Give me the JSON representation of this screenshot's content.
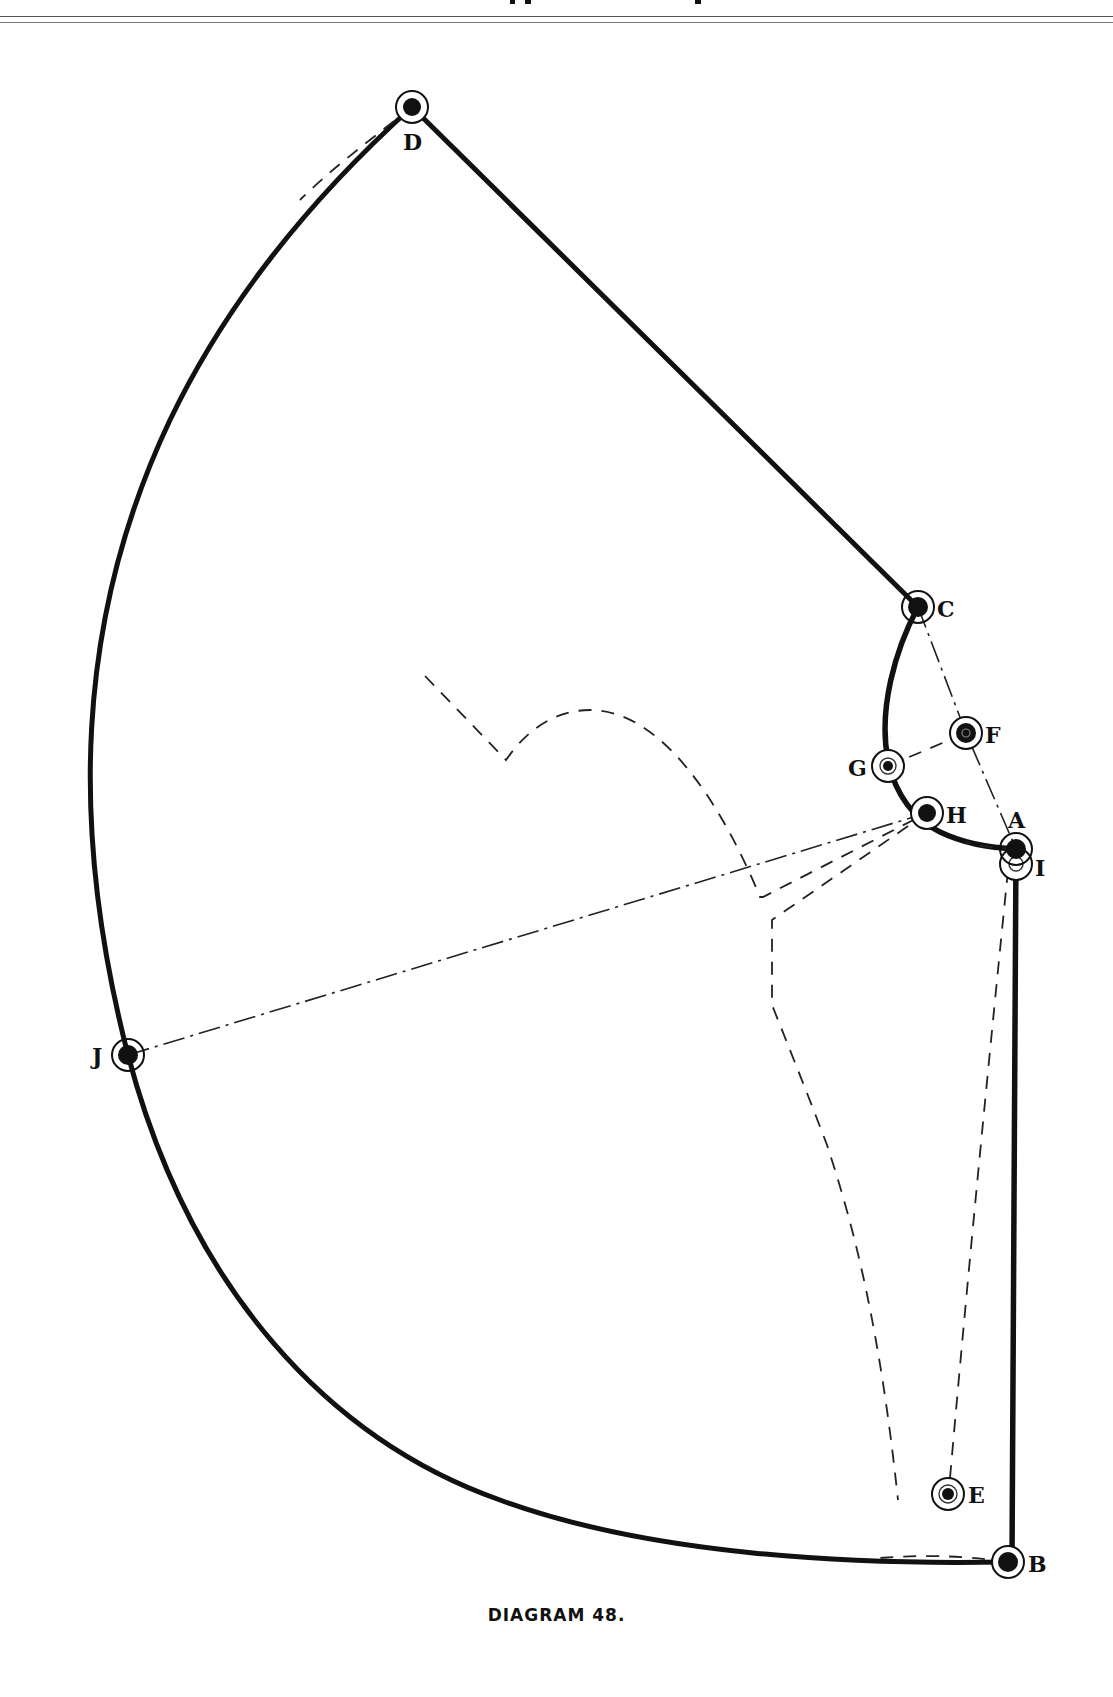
{
  "caption": "DIAGRAM 48.",
  "colors": {
    "ink": "#111111",
    "paper": "#ffffff"
  },
  "points": {
    "A": {
      "label": "A",
      "x": 1016,
      "y": 849
    },
    "B": {
      "label": "B",
      "x": 1008,
      "y": 1562
    },
    "C": {
      "label": "C",
      "x": 918,
      "y": 607
    },
    "D": {
      "label": "D",
      "x": 412,
      "y": 107
    },
    "E": {
      "label": "E",
      "x": 948,
      "y": 1494
    },
    "F": {
      "label": "F",
      "x": 966,
      "y": 733
    },
    "G": {
      "label": "G",
      "x": 888,
      "y": 766
    },
    "H": {
      "label": "H",
      "x": 927,
      "y": 813
    },
    "I": {
      "label": "I",
      "x": 1016,
      "y": 864
    },
    "J": {
      "label": "J",
      "x": 128,
      "y": 1055
    }
  },
  "lines": {
    "outline": "D-C straight, C-G-H-A curved, A-B straight, B-J-D arc",
    "dash_dot": [
      "J-H",
      "C-F-A"
    ],
    "dashed": [
      "G-F",
      "H-inner-panel",
      "I-E",
      "D-arc-guide",
      "B-arc-guide"
    ]
  }
}
